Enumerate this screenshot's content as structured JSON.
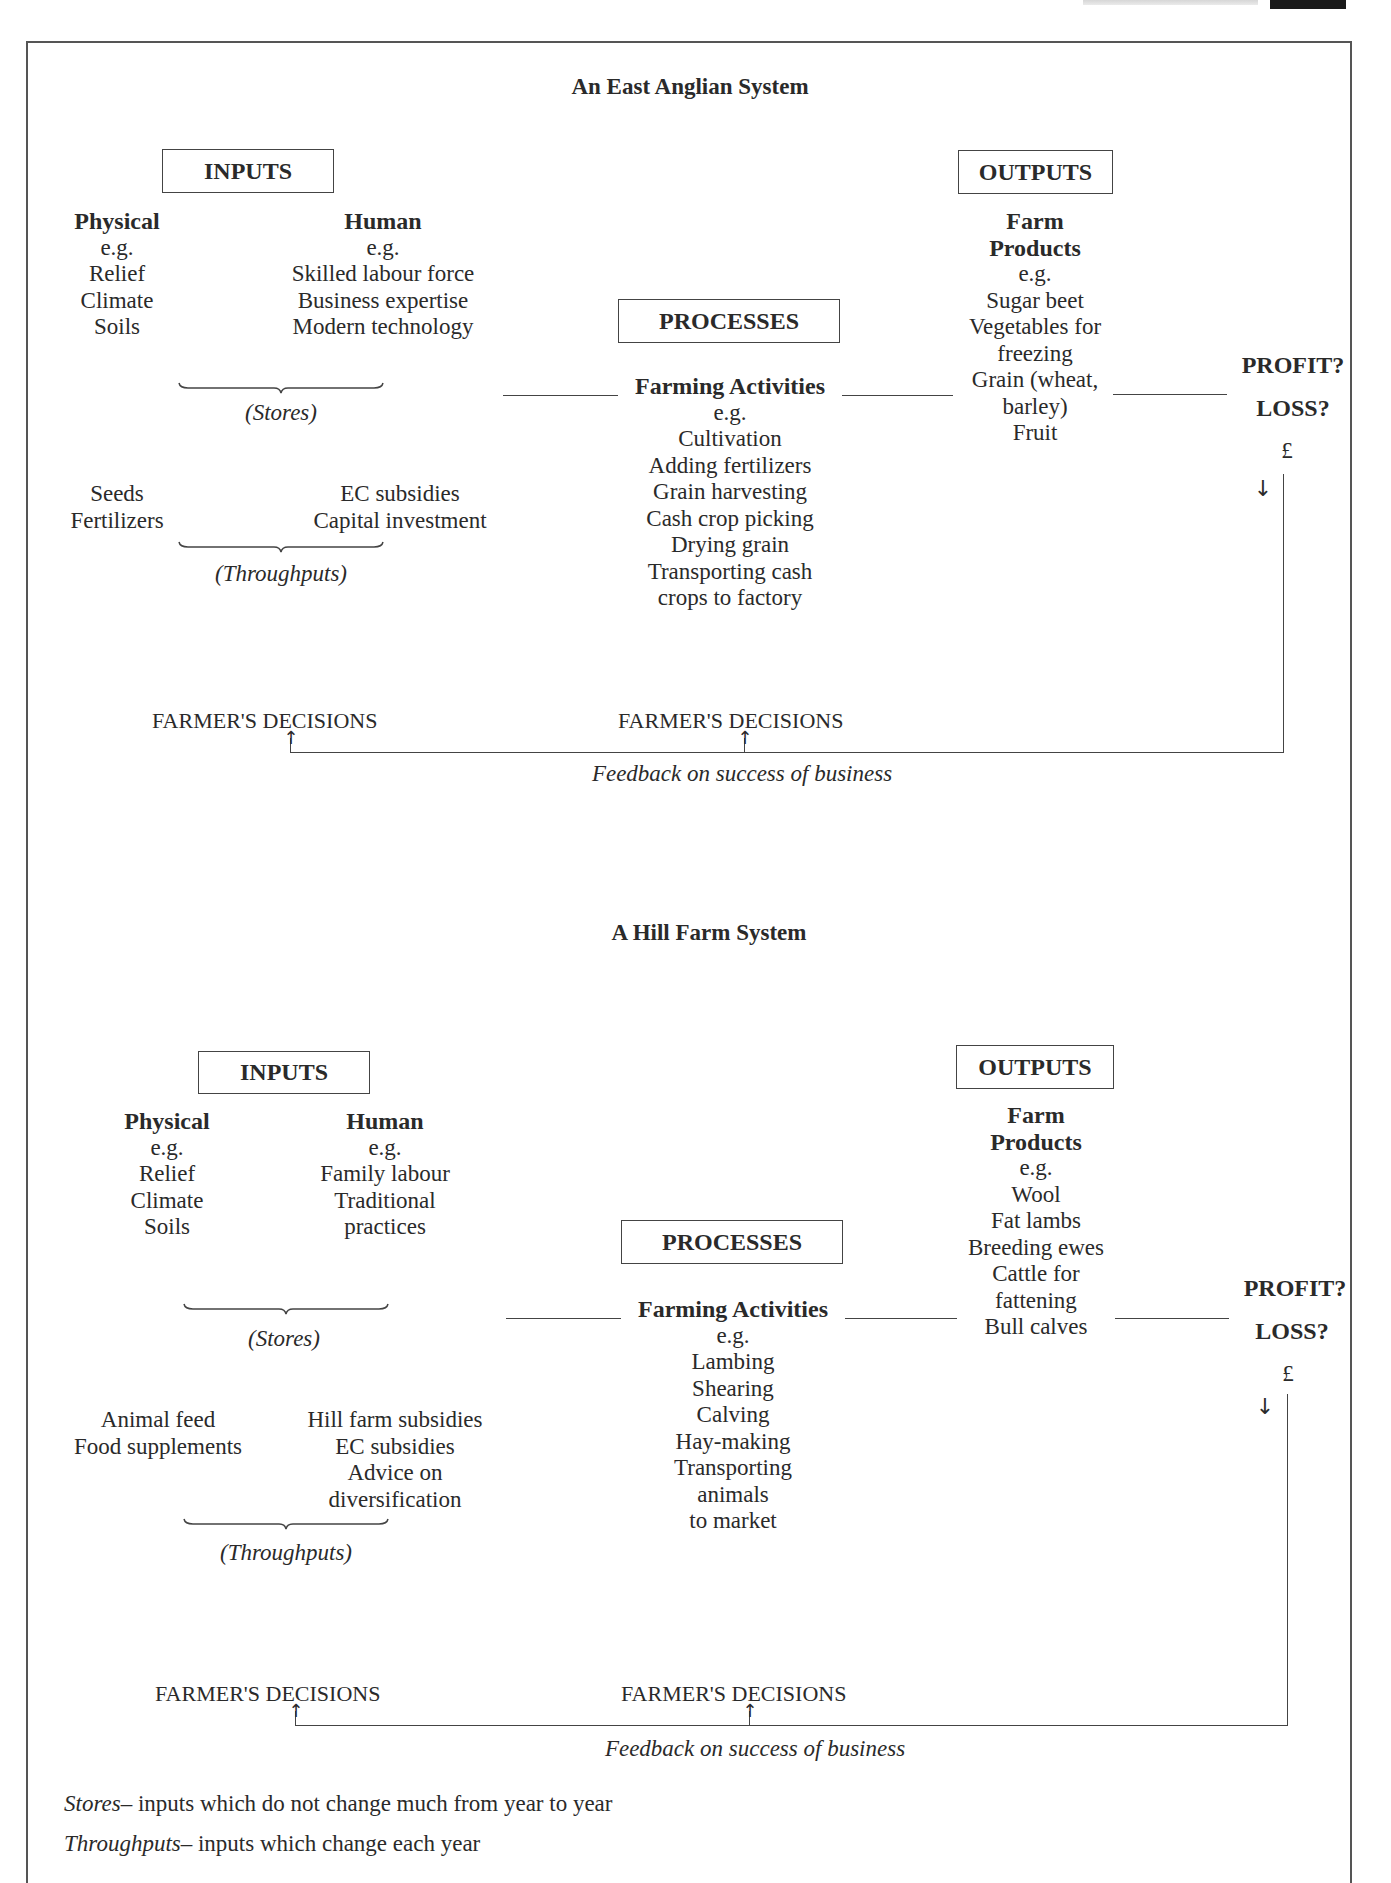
{
  "page": {
    "footer_notes": [
      {
        "term": "Stores",
        "definition": "– inputs which do not change much from year to year"
      },
      {
        "term": "Throughputs",
        "definition": "– inputs which change each year"
      }
    ]
  },
  "diagrams": [
    {
      "title": "An East Anglian System",
      "inputs": {
        "label": "INPUTS",
        "physical": {
          "heading": "Physical",
          "eg": "e.g.",
          "items": [
            "Relief",
            "Climate",
            "Soils"
          ]
        },
        "human": {
          "heading": "Human",
          "eg": "e.g.",
          "items": [
            "Skilled labour force",
            "Business expertise",
            "Modern technology"
          ]
        },
        "stores_label": "(Stores)",
        "throughputs_left": [
          "Seeds",
          "Fertilizers"
        ],
        "throughputs_right": [
          "EC subsidies",
          "Capital investment"
        ],
        "throughputs_label": "(Throughputs)"
      },
      "processes": {
        "label": "PROCESSES",
        "heading": "Farming Activities",
        "eg": "e.g.",
        "items": [
          "Cultivation",
          "Adding fertilizers",
          "Grain harvesting",
          "Cash crop picking",
          "Drying grain",
          "Transporting cash",
          "crops to factory"
        ]
      },
      "outputs": {
        "label": "OUTPUTS",
        "heading": [
          "Farm",
          "Products"
        ],
        "eg": "e.g.",
        "items": [
          "Sugar beet",
          "Vegetables for",
          "freezing",
          "Grain (wheat,",
          "barley)",
          "Fruit"
        ]
      },
      "result": {
        "profit": "PROFIT?",
        "loss": "LOSS?",
        "currency": "£"
      },
      "decisions": [
        "FARMER'S DECISIONS",
        "FARMER'S DECISIONS"
      ],
      "feedback": "Feedback on success of business"
    },
    {
      "title": "A Hill Farm System",
      "inputs": {
        "label": "INPUTS",
        "physical": {
          "heading": "Physical",
          "eg": "e.g.",
          "items": [
            "Relief",
            "Climate",
            "Soils"
          ]
        },
        "human": {
          "heading": "Human",
          "eg": "e.g.",
          "items": [
            "Family labour",
            "Traditional",
            "practices"
          ]
        },
        "stores_label": "(Stores)",
        "throughputs_left": [
          "Animal feed",
          "Food supplements"
        ],
        "throughputs_right": [
          "Hill farm subsidies",
          "EC subsidies",
          "Advice on",
          "diversification"
        ],
        "throughputs_label": "(Throughputs)"
      },
      "processes": {
        "label": "PROCESSES",
        "heading": "Farming Activities",
        "eg": "e.g.",
        "items": [
          "Lambing",
          "Shearing",
          "Calving",
          "Hay-making",
          "Transporting",
          "animals",
          "to market"
        ]
      },
      "outputs": {
        "label": "OUTPUTS",
        "heading": [
          "Farm",
          "Products"
        ],
        "eg": "e.g.",
        "items": [
          "Wool",
          "Fat lambs",
          "Breeding ewes",
          "Cattle for",
          "fattening",
          "Bull calves"
        ]
      },
      "result": {
        "profit": "PROFIT?",
        "loss": "LOSS?",
        "currency": "£"
      },
      "decisions": [
        "FARMER'S DECISIONS",
        "FARMER'S DECISIONS"
      ],
      "feedback": "Feedback on success of business"
    }
  ]
}
